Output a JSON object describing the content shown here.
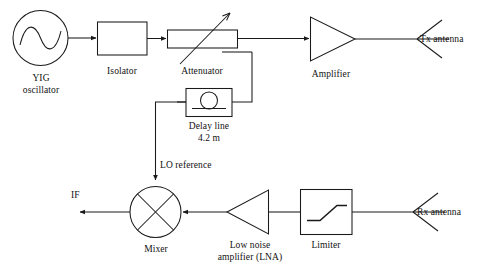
{
  "diagram": {
    "type": "block-diagram",
    "background_color": "#ffffff",
    "line_color": "#1a1a1a",
    "text_color": "#111111"
  },
  "blocks": {
    "yig_oscillator": {
      "label_line1": "YIG",
      "label_line2": "oscillator",
      "symbol": "sine-wave-in-circle"
    },
    "isolator": {
      "label": "Isolator",
      "symbol": "rectangle"
    },
    "attenuator": {
      "label": "Attenuator",
      "symbol": "rectangle-with-diagonal-arrow"
    },
    "amplifier": {
      "label": "Amplifier",
      "symbol": "triangle-right"
    },
    "delay_line": {
      "label_line1": "Delay line",
      "label_line2": "4.2 m",
      "symbol": "circle-with-line-in-box"
    },
    "mixer": {
      "label": "Mixer",
      "symbol": "circle-with-cross"
    },
    "lna": {
      "label_line1": "Low noise",
      "label_line2": "amplifier (LNA)",
      "symbol": "triangle-left"
    },
    "limiter": {
      "label": "Limiter",
      "symbol": "saturation-curve-in-box"
    }
  },
  "ports": {
    "tx_antenna": {
      "label": "Tx antenna",
      "symbol": "antenna-icon"
    },
    "rx_antenna": {
      "label": "Rx antenna",
      "symbol": "antenna-icon"
    },
    "if_output": {
      "label": "IF"
    },
    "lo_reference": {
      "label": "LO reference"
    }
  }
}
